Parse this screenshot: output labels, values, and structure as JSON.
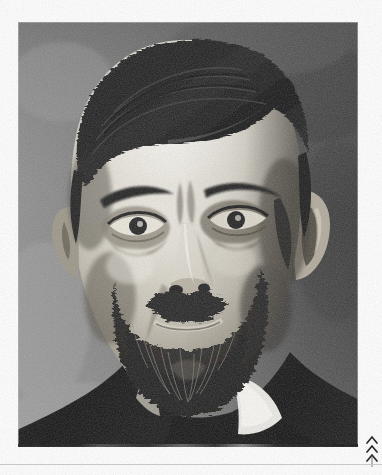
{
  "page": {
    "kind": "scanned-book-page",
    "background_color": "#fefefe",
    "width_px": 382,
    "height_px": 475
  },
  "photograph": {
    "name": "portrait-photograph",
    "subject_description": "Half-length monochrome studio portrait of an older bearded man facing the viewer",
    "medium": "halftone-screened black and white photographic reproduction",
    "frame": {
      "x": 18,
      "y": 22,
      "width": 340,
      "height": 425
    },
    "tones": {
      "background_upper_left": "#7c7c7c",
      "background_upper_right": "#3a3a3a",
      "background_lower_left": "#8f8f8f",
      "background_lower_right": "#2e2e2e",
      "highlight_skin": "#f2f0ea",
      "midtone_skin": "#c9c3b8",
      "shadow_skin": "#6a6458",
      "hair_dark": "#141414",
      "beard_dark": "#1a1a1a",
      "suit_black": "#0d0d0d",
      "collar_white": "#f6f4ee"
    },
    "features": [
      {
        "name": "hair",
        "note": "dark, thick, swept back from a high forehead, parted high on the left"
      },
      {
        "name": "forehead",
        "note": "broad and brightly lit, strongest highlight of the image"
      },
      {
        "name": "eyebrows",
        "note": "heavy dark brows, slightly lowered, furrowed centre"
      },
      {
        "name": "eyes",
        "note": "deep-set, direct gaze toward the camera, shadowed sockets"
      },
      {
        "name": "nose",
        "note": "long and straight with a dark nostril shadow"
      },
      {
        "name": "moustache",
        "note": "full, dark, drooping over the upper lip"
      },
      {
        "name": "beard",
        "note": "long, dense, greying full beard covering the chin and jaw"
      },
      {
        "name": "ears",
        "note": "both ears visible at the edges of the head"
      },
      {
        "name": "collar",
        "note": "bright white stand collar at the right of the neck"
      },
      {
        "name": "jacket",
        "note": "black coat shoulders filling the lower corners"
      }
    ]
  },
  "margin_marks": {
    "chevrons": {
      "name": "chevron-marks",
      "glyph": "^",
      "count": 3,
      "orientation": "pointing-up",
      "color": "#1a1a1a",
      "position": "bottom-right-margin"
    },
    "stem": {
      "name": "vertical-stem-mark",
      "color": "#7d7d7d"
    },
    "scan_line": {
      "name": "scanner-artifact-line",
      "color": "#c9c9c9"
    }
  }
}
